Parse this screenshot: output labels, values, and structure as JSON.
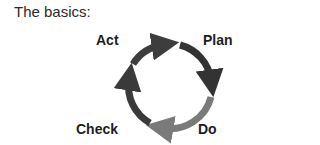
{
  "heading": "The basics:",
  "cycle": {
    "stages": [
      {
        "label": "Plan",
        "color": "#333333"
      },
      {
        "label": "Do",
        "color": "#7a7a7a"
      },
      {
        "label": "Check",
        "color": "#3a3a3a"
      },
      {
        "label": "Act",
        "color": "#3d3d3d"
      }
    ]
  }
}
